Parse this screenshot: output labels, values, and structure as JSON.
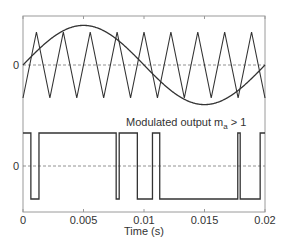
{
  "chart_data": {
    "type": "line",
    "title": "",
    "xlabel": "Time (s)",
    "ylabel": "",
    "xlim": [
      0,
      0.02
    ],
    "x_ticks": [
      "0",
      "0.005",
      "0.01",
      "0.015",
      "0.02"
    ],
    "x_tick_values": [
      0,
      0.005,
      0.01,
      0.015,
      0.02
    ],
    "grid": false,
    "legend": null,
    "panels": [
      {
        "name": "carrier-and-reference",
        "y_ticks": [
          "0"
        ],
        "series": [
          {
            "name": "Reference sine",
            "type": "sine",
            "frequency_hz": 50,
            "amplitude": 1.2,
            "phase": 0
          },
          {
            "name": "Triangular carrier",
            "type": "triangle",
            "frequency_hz": 450,
            "amplitude": 1.0,
            "starts_at": "trough"
          }
        ],
        "zero_line": "dashed"
      },
      {
        "name": "modulated-output",
        "y_ticks": [
          "0"
        ],
        "annotation": {
          "text_main": "Modulated output  m",
          "text_sub": "a",
          "text_tail": " > 1"
        },
        "series": [
          {
            "name": "PWM output",
            "type": "square",
            "levels": [
              -1,
              1
            ],
            "transitions_s": [
              0.00065,
              0.00132,
              0.0077,
              0.00795,
              0.00945,
              0.0107,
              0.0113,
              0.01775,
              0.01795,
              0.0196
            ],
            "initial_level": 1
          }
        ],
        "zero_line": "dashed"
      }
    ]
  },
  "colors": {
    "line": "#333333",
    "axis": "#9a9a9a",
    "zero_line": "#777777",
    "background": "#ffffff"
  }
}
